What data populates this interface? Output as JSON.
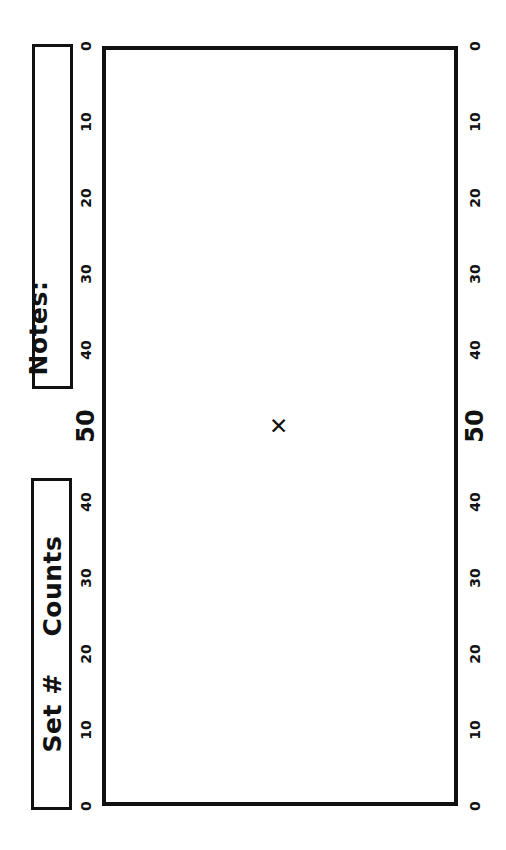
{
  "form": {
    "notes_label": "Notes:",
    "set_counts_label": "Set #    Counts"
  },
  "chart_data": {
    "type": "scatter",
    "title": "",
    "subtitle": "",
    "xlabel": "",
    "ylabel": "Counts",
    "orientation": "rotated-90",
    "grid": true,
    "legend": false,
    "axis_left_ticks": [
      {
        "value": 0,
        "label": "0",
        "emphasis": false
      },
      {
        "value": 10,
        "label": "10",
        "emphasis": false
      },
      {
        "value": 20,
        "label": "20",
        "emphasis": false
      },
      {
        "value": 30,
        "label": "30",
        "emphasis": false
      },
      {
        "value": 40,
        "label": "40",
        "emphasis": false
      },
      {
        "value": 50,
        "label": "50",
        "emphasis": true
      },
      {
        "value": 60,
        "label": "40",
        "emphasis": false
      },
      {
        "value": 70,
        "label": "30",
        "emphasis": false
      },
      {
        "value": 80,
        "label": "20",
        "emphasis": false
      },
      {
        "value": 90,
        "label": "10",
        "emphasis": false
      },
      {
        "value": 100,
        "label": "0",
        "emphasis": false
      }
    ],
    "axis_right_ticks": [
      {
        "value": 0,
        "label": "0",
        "emphasis": false
      },
      {
        "value": 10,
        "label": "10",
        "emphasis": false
      },
      {
        "value": 20,
        "label": "20",
        "emphasis": false
      },
      {
        "value": 30,
        "label": "30",
        "emphasis": false
      },
      {
        "value": 40,
        "label": "40",
        "emphasis": false
      },
      {
        "value": 50,
        "label": "50",
        "emphasis": true
      },
      {
        "value": 60,
        "label": "40",
        "emphasis": false
      },
      {
        "value": 70,
        "label": "30",
        "emphasis": false
      },
      {
        "value": 80,
        "label": "20",
        "emphasis": false
      },
      {
        "value": 90,
        "label": "10",
        "emphasis": false
      },
      {
        "value": 100,
        "label": "0",
        "emphasis": false
      }
    ],
    "ylim": [
      0,
      100
    ],
    "major_gridlines": [
      0,
      10,
      20,
      30,
      40,
      50,
      60,
      70,
      80,
      90,
      100
    ],
    "minor_gridlines": [
      5,
      15,
      25,
      35,
      45,
      55,
      65,
      75,
      85,
      95
    ],
    "x_columns": 24,
    "dashed_reference_columns": [
      7.75,
      15.9
    ],
    "points": [
      {
        "x_column": 11.9,
        "y_value": 50,
        "marker": "x"
      }
    ],
    "colors": {
      "frame": "#111111",
      "major_grid": "#1a1a1a",
      "minor_grid": "#777777",
      "vertical_grid": "#5a5a5a",
      "marker": "#111111",
      "background": "#ffffff"
    }
  }
}
